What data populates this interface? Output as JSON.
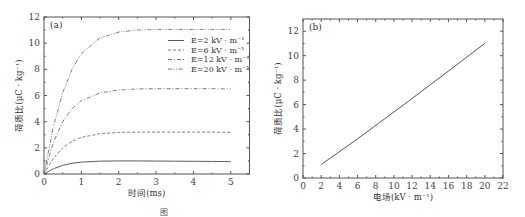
{
  "chart_data": [
    {
      "panel": "(a)",
      "type": "line",
      "title": "",
      "xlabel": "时间(ms)",
      "ylabel": "荷质比(μC·kg⁻¹)",
      "xlim": [
        0,
        5.5
      ],
      "ylim": [
        0,
        12
      ],
      "xticks": [
        "0",
        "1",
        "2",
        "3",
        "4",
        "5"
      ],
      "yticks": [
        "0",
        "2",
        "4",
        "6",
        "8",
        "10",
        "12"
      ],
      "grid": false,
      "legend_position": "upper right",
      "x": [
        0,
        0.25,
        0.5,
        0.75,
        1.0,
        1.5,
        2.0,
        2.5,
        3.0,
        3.5,
        4.0,
        4.5,
        5.0
      ],
      "series": [
        {
          "name": "E=2 kV·m⁻¹",
          "style": "solid",
          "values": [
            0,
            0.4,
            0.66,
            0.82,
            0.91,
            0.98,
            1.0,
            1.0,
            0.99,
            0.98,
            0.97,
            0.96,
            0.95
          ]
        },
        {
          "name": "E=6 kV·m⁻¹",
          "style": "dashed",
          "values": [
            0,
            1.2,
            2.0,
            2.5,
            2.8,
            3.08,
            3.18,
            3.2,
            3.2,
            3.2,
            3.2,
            3.2,
            3.18
          ]
        },
        {
          "name": "E=12 kV·m⁻¹",
          "style": "dash-dot",
          "values": [
            0,
            2.4,
            4.0,
            5.0,
            5.6,
            6.2,
            6.42,
            6.5,
            6.52,
            6.52,
            6.52,
            6.52,
            6.5
          ]
        },
        {
          "name": "E=20 kV·m⁻¹",
          "style": "dash-dot-dot",
          "values": [
            0,
            3.6,
            6.2,
            8.0,
            9.2,
            10.4,
            10.85,
            11.0,
            11.05,
            11.05,
            11.05,
            11.05,
            11.05
          ]
        }
      ]
    },
    {
      "panel": "(b)",
      "type": "line",
      "title": "",
      "xlabel": "电场(kV·m⁻¹)",
      "ylabel": "荷质比(μC·kg⁻¹)",
      "xlim": [
        0,
        22
      ],
      "ylim": [
        0,
        13
      ],
      "xticks": [
        "0",
        "2",
        "4",
        "6",
        "8",
        "10",
        "12",
        "14",
        "16",
        "18",
        "20",
        "22"
      ],
      "yticks": [
        "0",
        "2",
        "4",
        "6",
        "8",
        "10",
        "12"
      ],
      "grid": false,
      "x": [
        2,
        6,
        12,
        20
      ],
      "series": [
        {
          "name": "荷质比",
          "style": "solid",
          "values": [
            1.1,
            3.2,
            6.5,
            11.0
          ]
        }
      ]
    }
  ],
  "labels": {
    "panel_a": "(a)",
    "panel_b": "(b)",
    "xlabel_a": "时间(ms)",
    "xlabel_b": "电场(kV · m⁻¹)",
    "ylabel_a": "荷质比(μC · kg⁻¹)",
    "ylabel_b": "荷质比(μC · kg⁻¹)",
    "legend": [
      "E=2  kV · m⁻¹",
      "E=6  kV · m⁻¹",
      "E=12  kV · m⁻¹",
      "E=20  kV · m⁻¹"
    ],
    "caption": "图"
  }
}
